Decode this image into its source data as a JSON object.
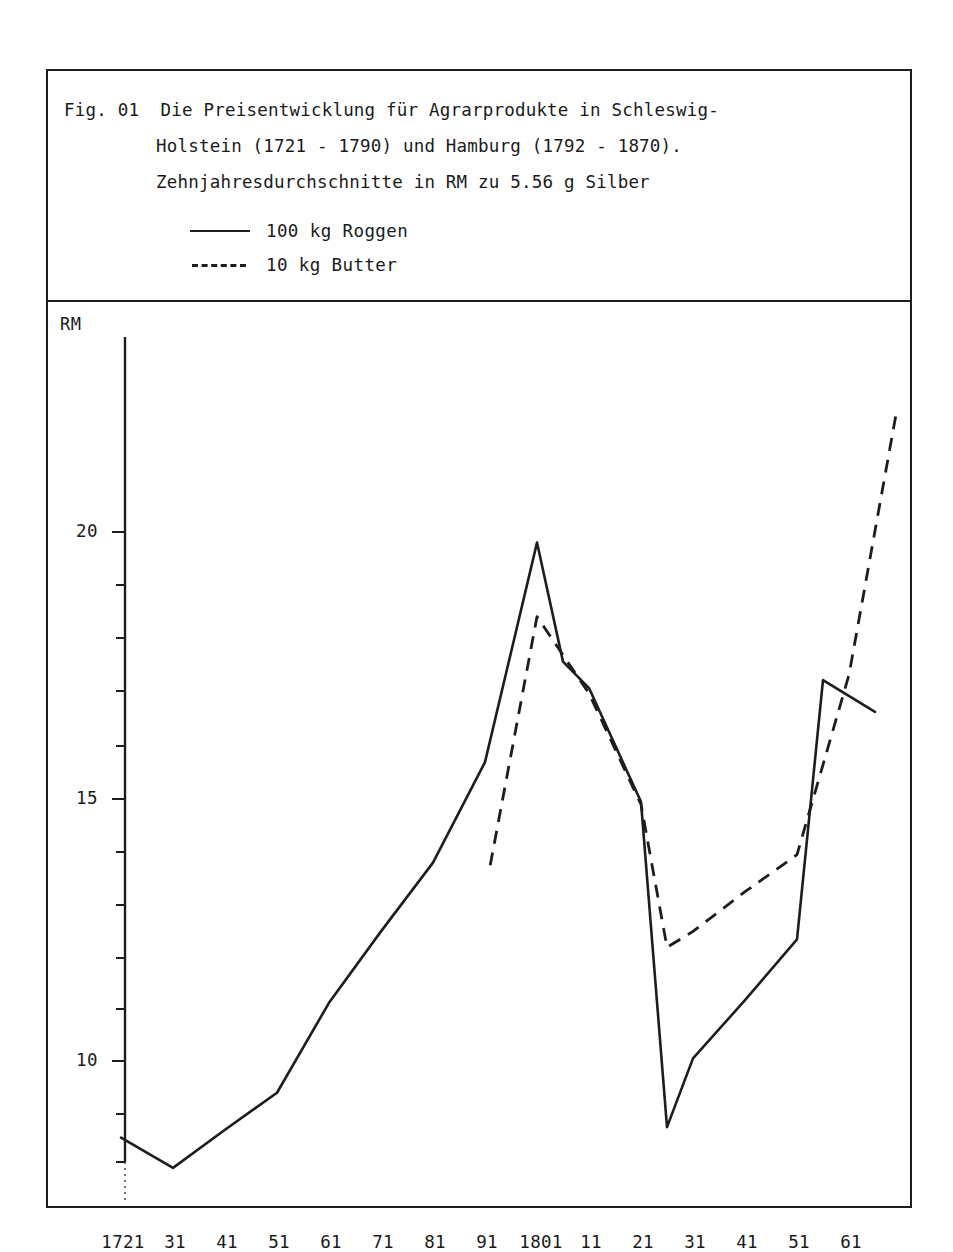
{
  "figure": {
    "label": "Fig. 01",
    "caption_lines": [
      "Fig. 01  Die Preisentwicklung für Agrarprodukte in Schleswig-",
      "Holstein (1721 - 1790) und Hamburg (1792 - 1870).",
      "Zehnjahresdurchschnitte in RM zu 5.56 g Silber"
    ]
  },
  "legend": {
    "position": "inside-caption-block",
    "entries": [
      {
        "label": "100 kg Roggen",
        "style": "solid"
      },
      {
        "label": "10 kg Butter",
        "style": "dashed"
      }
    ]
  },
  "chart_data": {
    "type": "line",
    "xlabel": "",
    "ylabel": "RM",
    "y_unit_label": "RM",
    "grid": false,
    "legend_entries": [
      "100 kg Roggen",
      "10 kg Butter"
    ],
    "x_tick_labels": [
      "1721",
      "31",
      "41",
      "51",
      "61",
      "71",
      "81",
      "91",
      "1801",
      "11",
      "21",
      "31",
      "41",
      "51",
      "61"
    ],
    "x": [
      1721,
      1731,
      1741,
      1751,
      1761,
      1771,
      1781,
      1791,
      1801,
      1811,
      1821,
      1831,
      1841,
      1851,
      1861
    ],
    "y_tick_labels": [
      "20",
      "15",
      "10"
    ],
    "y_ticks": [
      20,
      15,
      10
    ],
    "y_minor_tick_step": 1,
    "ylim": [
      7.0,
      22.6
    ],
    "xlim": [
      1721,
      1871
    ],
    "series": [
      {
        "name": "100 kg Roggen",
        "style": "solid",
        "x": [
          1721,
          1731,
          1741,
          1751,
          1761,
          1771,
          1781,
          1791,
          1801,
          1806,
          1811,
          1821,
          1826,
          1831,
          1841,
          1851,
          1856,
          1866
        ],
        "values": [
          8.55,
          7.98,
          8.7,
          9.4,
          11.1,
          12.45,
          13.75,
          15.65,
          19.8,
          17.55,
          17.05,
          14.9,
          8.75,
          10.05,
          11.15,
          12.3,
          17.2,
          16.6
        ]
      },
      {
        "name": "10 kg Butter",
        "style": "dashed",
        "x": [
          1792,
          1801,
          1811,
          1821,
          1826,
          1831,
          1841,
          1851,
          1861,
          1870
        ],
        "values": [
          13.7,
          18.4,
          16.95,
          14.85,
          12.15,
          12.45,
          13.2,
          13.9,
          17.3,
          22.2
        ]
      }
    ]
  }
}
